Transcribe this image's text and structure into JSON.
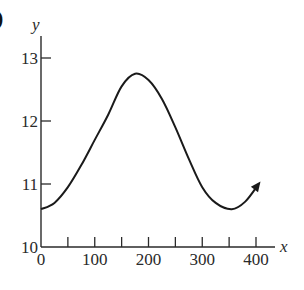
{
  "panel_label": ")",
  "chart_data": {
    "type": "line",
    "title": "",
    "xlabel": "x",
    "ylabel": "y",
    "xlim": [
      0,
      420
    ],
    "ylim": [
      10,
      13.3
    ],
    "x_ticks": [
      0,
      50,
      100,
      150,
      200,
      250,
      300,
      350,
      400
    ],
    "x_tick_labels": [
      "0",
      "100",
      "200",
      "300",
      "400"
    ],
    "x_tick_label_values": [
      0,
      100,
      200,
      300,
      400
    ],
    "y_ticks": [
      11,
      12,
      13
    ],
    "y_tick_labels": [
      "10",
      "11",
      "12",
      "13"
    ],
    "y_tick_label_values": [
      10,
      11,
      12,
      13
    ],
    "grid": false,
    "legend": null,
    "annotations": [
      "arrowhead at curve end indicating continuation"
    ],
    "series": [
      {
        "name": "curve",
        "x": [
          0,
          25,
          50,
          75,
          100,
          125,
          150,
          175,
          200,
          225,
          250,
          275,
          300,
          325,
          355,
          380,
          405
        ],
        "y": [
          10.6,
          10.7,
          10.95,
          11.3,
          11.7,
          12.1,
          12.55,
          12.75,
          12.65,
          12.35,
          11.9,
          11.4,
          10.95,
          10.7,
          10.6,
          10.72,
          11.0
        ]
      }
    ],
    "color": "#1a1a1a"
  }
}
